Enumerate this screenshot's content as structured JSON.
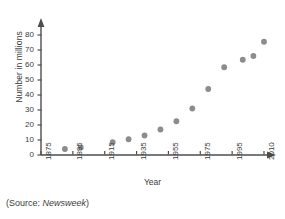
{
  "chart_data": {
    "type": "scatter",
    "title": "",
    "xlabel": "Year",
    "ylabel": "Number in millions",
    "xlim": [
      1875,
      2010
    ],
    "ylim": [
      0,
      85
    ],
    "grid": false,
    "legend": "none",
    "marker_color": "#8c8c8c",
    "axis_color": "#4d4d4d",
    "xticks": [
      "1875",
      "1895",
      "1915",
      "1935",
      "1955",
      "1975",
      "1995",
      "2010"
    ],
    "xtick_values": [
      1875,
      1895,
      1915,
      1935,
      1955,
      1975,
      1995,
      2010
    ],
    "yticks": [
      "0",
      "10",
      "20",
      "30",
      "40",
      "50",
      "60",
      "70",
      "80"
    ],
    "ytick_values": [
      0,
      10,
      20,
      30,
      40,
      50,
      60,
      70,
      80
    ],
    "x": [
      1890,
      1900,
      1920,
      1930,
      1940,
      1950,
      1960,
      1970,
      1980,
      1990,
      2000,
      2005,
      2010
    ],
    "values": [
      4,
      5,
      8.5,
      10.5,
      13,
      17,
      22.5,
      31,
      44,
      58.5,
      63.5,
      66,
      75.5
    ],
    "series": [
      {
        "name": "Number in millions",
        "x": [
          1890,
          1900,
          1920,
          1930,
          1940,
          1950,
          1960,
          1970,
          1980,
          1990,
          2000,
          2005,
          2010
        ],
        "values": [
          4,
          5,
          8.5,
          10.5,
          13,
          17,
          22.5,
          31,
          44,
          58.5,
          63.5,
          66,
          75.5
        ]
      }
    ]
  },
  "source": {
    "prefix": "(Source: ",
    "publication": "Newsweek",
    "suffix": ")"
  }
}
